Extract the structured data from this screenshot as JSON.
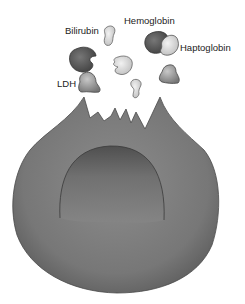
{
  "diagram": {
    "labels": {
      "bilirubin": "Bilirubin",
      "hemoglobin": "Hemoglobin",
      "haptoglobin": "Haptoglobin",
      "ldh": "LDH"
    },
    "colors": {
      "cell": "#7a7a7a",
      "cell_dark": "#5a5a5a",
      "dark_molecule": "#555555",
      "light_molecule": "#d8d8d8",
      "mid_molecule": "#9a9a9a",
      "text": "#222222"
    }
  }
}
